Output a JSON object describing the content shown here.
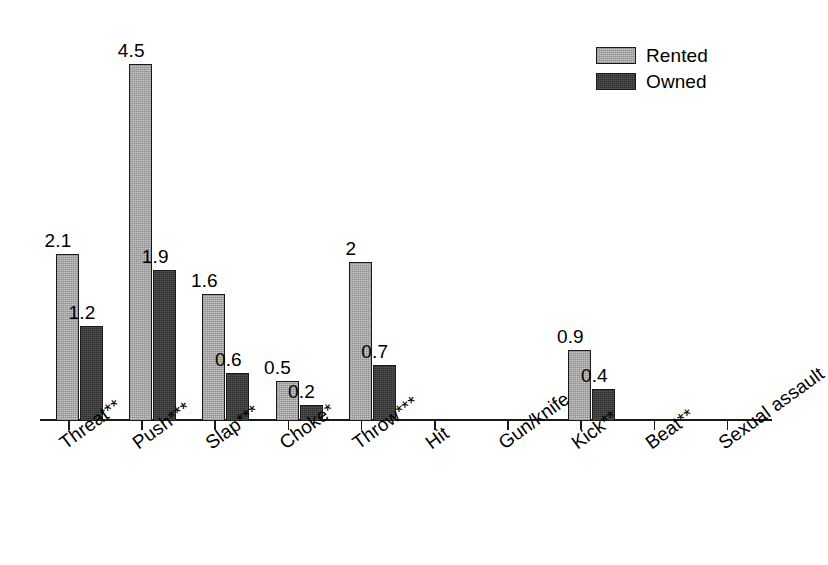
{
  "legend": {
    "position": "top-right",
    "items": [
      {
        "label": "Rented",
        "color": "#c6c6c6",
        "swatch": "rented-swatch"
      },
      {
        "label": "Owned",
        "color": "#2e2e2e",
        "swatch": "owned-swatch"
      }
    ]
  },
  "chart_data": {
    "type": "bar",
    "title": "",
    "subtitle": "",
    "xlabel": "",
    "ylabel": "",
    "ylim": [
      0,
      4.8
    ],
    "grid": false,
    "legend_position": "top-right",
    "categories": [
      "Threat**",
      "Push***",
      "Slap***",
      "Choke*",
      "Throw***",
      "Hit",
      "Gun/knife",
      "Kick**",
      "Beat**",
      "Sexual assault"
    ],
    "series": [
      {
        "name": "Rented",
        "color": "#c6c6c6",
        "values": [
          2.1,
          4.5,
          1.6,
          0.5,
          2,
          0,
          0,
          0.9,
          0,
          0
        ],
        "labels": [
          "2.1",
          "4.5",
          "1.6",
          "0.5",
          "2",
          "",
          "",
          "0.9",
          "",
          ""
        ]
      },
      {
        "name": "Owned",
        "color": "#2e2e2e",
        "values": [
          1.2,
          1.9,
          0.6,
          0.2,
          0.7,
          0,
          0,
          0.4,
          0,
          0
        ],
        "labels": [
          "1.2",
          "1.9",
          "0.6",
          "0.2",
          "0.7",
          "",
          "",
          "0.4",
          "",
          ""
        ]
      }
    ]
  }
}
